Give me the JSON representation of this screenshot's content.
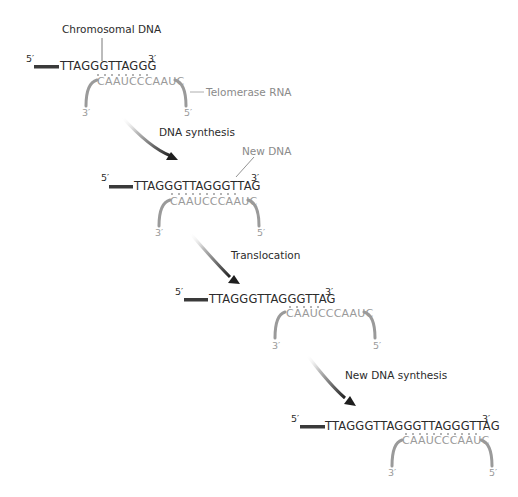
{
  "colors": {
    "dna_text": "#2b2b2b",
    "rna_text": "#9a9a9a",
    "rna_arc": "#9a9a9a",
    "dna_bar": "#3a3a3a",
    "arrow_head": "#1e1e1e"
  },
  "stage1": {
    "label_chromosomal": "Chromosomal DNA",
    "label_telomerase": "Telomerase RNA",
    "five_prime": "5′",
    "three_prime": "3′",
    "dna_seq": "TTAGGGTTAGGG",
    "rna_seq": "CAAUCCCAAUC",
    "rna_three_prime": "3′",
    "rna_five_prime": "5′"
  },
  "step1": {
    "label": "DNA synthesis"
  },
  "stage2": {
    "label_new_dna": "New DNA",
    "five_prime": "5′",
    "three_prime": "3′",
    "dna_seq": "TTAGGGTTAGGGTTAG",
    "rna_seq": "CAAUCCCAAUC",
    "rna_three_prime": "3′",
    "rna_five_prime": "5′"
  },
  "step2": {
    "label": "Translocation"
  },
  "stage3": {
    "five_prime": "5′",
    "three_prime": "3′",
    "dna_seq": "TTAGGGTTAGGGTTAG",
    "rna_seq": "CAAUCCCAAUC",
    "rna_three_prime": "3′",
    "rna_five_prime": "5′"
  },
  "step3": {
    "label": "New DNA synthesis"
  },
  "stage4": {
    "five_prime": "5′",
    "three_prime": "3′",
    "dna_seq": "TTAGGGTTAGGGTTAGGGTTAG",
    "rna_seq": "CAAUCCCAAUC",
    "rna_three_prime": "3′",
    "rna_five_prime": "5′"
  }
}
